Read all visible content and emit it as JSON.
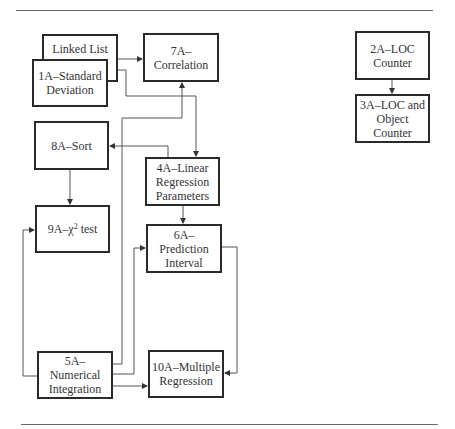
{
  "diagram": {
    "type": "dependency-flowchart",
    "nodes": [
      {
        "id": "linked-list",
        "label": "Linked List"
      },
      {
        "id": "1a",
        "label_line1": "1A–Standard",
        "label_line2": "Deviation"
      },
      {
        "id": "7a",
        "label": "7A–Correlation"
      },
      {
        "id": "2a",
        "label_line1": "2A–LOC",
        "label_line2": "Counter"
      },
      {
        "id": "3a",
        "label_line1": "3A–LOC and",
        "label_line2": "Object Counter"
      },
      {
        "id": "8a",
        "label": "8A–Sort"
      },
      {
        "id": "4a",
        "label_line1": "4A–Linear",
        "label_line2": "Regression",
        "label_line3": "Parameters"
      },
      {
        "id": "9a",
        "label_prefix": "9A–χ",
        "label_sup": "2",
        "label_suffix": " test"
      },
      {
        "id": "6a",
        "label_line1": "6A–Prediction",
        "label_line2": "Interval"
      },
      {
        "id": "5a",
        "label_line1": "5A–Numerical",
        "label_line2": "Integration"
      },
      {
        "id": "10a",
        "label_line1": "10A–Multiple",
        "label_line2": "Regression"
      }
    ],
    "edges": [
      {
        "from": "linked-list",
        "to": "7a"
      },
      {
        "from": "1a",
        "to": "4a"
      },
      {
        "from": "2a",
        "to": "3a"
      },
      {
        "from": "4a",
        "to": "8a"
      },
      {
        "from": "8a",
        "to": "9a"
      },
      {
        "from": "4a",
        "to": "6a"
      },
      {
        "from": "5a",
        "to": "7a"
      },
      {
        "from": "5a",
        "to": "6a"
      },
      {
        "from": "5a",
        "to": "9a"
      },
      {
        "from": "5a",
        "to": "10a"
      },
      {
        "from": "6a",
        "to": "10a"
      }
    ]
  },
  "colors": {
    "box_border": "#2a2a2a",
    "connector": "#555555",
    "text": "#333333",
    "rule": "#6a6a6a"
  }
}
